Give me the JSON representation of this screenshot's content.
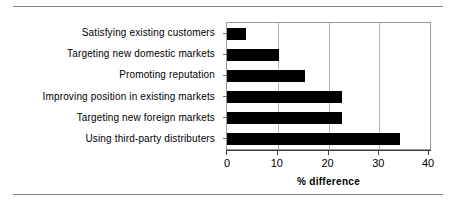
{
  "chart_data": {
    "type": "bar",
    "orientation": "horizontal",
    "title": "",
    "xlabel": "% difference",
    "ylabel": "",
    "xlim": [
      0,
      40
    ],
    "xticks": [
      0,
      10,
      20,
      30,
      40
    ],
    "grid": true,
    "legend": false,
    "categories": [
      "Satisfying existing customers",
      "Targeting new domestic markets",
      "Promoting reputation",
      "Improving position in existing markets",
      "Targeting new foreign markets",
      "Using third-party distributers"
    ],
    "values": [
      3.7,
      10.2,
      15.4,
      22.7,
      22.7,
      34.0
    ],
    "bar_color": "#000000"
  }
}
